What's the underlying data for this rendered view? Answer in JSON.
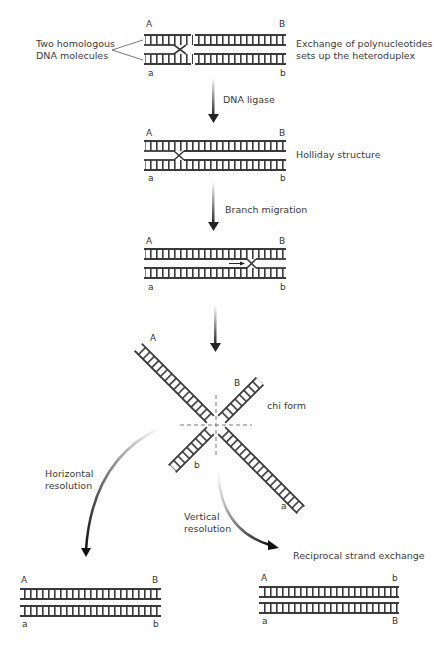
{
  "stage1": {
    "left_label_line1": "Two homologous",
    "left_label_line2": "DNA molecules",
    "right_label_line1": "Exchange of polynucleotides",
    "right_label_line2": "sets up the heteroduplex",
    "ends": {
      "top_left": "A",
      "top_right": "B",
      "bottom_left": "a",
      "bottom_right": "b"
    }
  },
  "step1": {
    "label": "DNA ligase"
  },
  "stage2": {
    "label": "Holliday structure",
    "ends": {
      "top_left": "A",
      "top_right": "B",
      "bottom_left": "a",
      "bottom_right": "b"
    }
  },
  "step2": {
    "label": "Branch migration"
  },
  "stage3": {
    "ends": {
      "top_left": "A",
      "top_right": "B",
      "bottom_left": "a",
      "bottom_right": "b"
    }
  },
  "stage4": {
    "label": "chi form",
    "ends": {
      "upper_left": "A",
      "upper_right": "B",
      "lower_left": "b",
      "lower_right": "a"
    }
  },
  "horizontal": {
    "label_line1": "Horizontal",
    "label_line2": "resolution",
    "ends": {
      "top_left": "A",
      "top_right": "B",
      "bottom_left": "a",
      "bottom_right": "b"
    }
  },
  "vertical": {
    "label_line1": "Vertical",
    "label_line2": "resolution",
    "result_label": "Reciprocal strand exchange",
    "ends": {
      "top_left": "A",
      "top_right": "b",
      "bottom_left": "a",
      "bottom_right": "B"
    }
  },
  "colors": {
    "strand": "#3a3a3a",
    "arrow": "#222222",
    "text": "#3a3a3a"
  }
}
